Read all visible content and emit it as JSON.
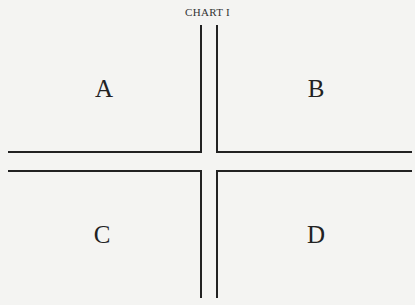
{
  "title": "CHART I",
  "quadrants": {
    "top_left": "A",
    "top_right": "B",
    "bottom_left": "C",
    "bottom_right": "D"
  }
}
